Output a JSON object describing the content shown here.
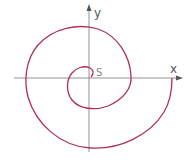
{
  "diagram": {
    "labels": {
      "x_axis": "x",
      "y_axis": "y",
      "start": "S"
    },
    "colors": {
      "curve": "#b03050",
      "axes": "#777777",
      "background": "#ffffff"
    }
  }
}
